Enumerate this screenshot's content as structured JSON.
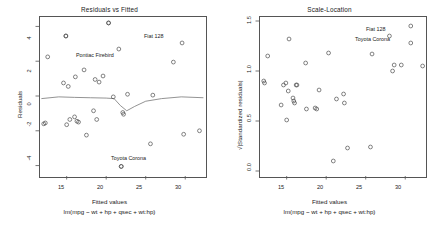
{
  "figure": {
    "panels": [
      {
        "key": "residuals_vs_fitted",
        "title": "Residuals vs Fitted",
        "xlabel": "Fitted values",
        "sublabel": "lm(mpg ~ wt + hp + qsec + wt:hp)",
        "ylabel": "Residuals",
        "xticks": [
          "15",
          "20",
          "25",
          "30"
        ],
        "yticks": [
          "4",
          "2",
          "0",
          "-2",
          "-4"
        ],
        "annotations": [
          {
            "text": "Fiat 128",
            "align": "right"
          },
          {
            "text": "Pontiac Firebird",
            "align": "left"
          },
          {
            "text": "Toyota Corona",
            "align": "right"
          }
        ]
      },
      {
        "key": "scale_location",
        "title": "Scale-Location",
        "xlabel": "Fitted values",
        "sublabel": "lm(mpg ~ wt + hp + qsec + wt:hp)",
        "ylabel": "√|Standardized residuals|",
        "xticks": [
          "15",
          "20",
          "25",
          "30"
        ],
        "yticks": [
          "1.5",
          "1.0",
          "0.5",
          "0.0"
        ],
        "annotations": [
          {
            "text": "Fiat 128",
            "align": "right"
          },
          {
            "text": "Toyota Corona",
            "align": "left"
          }
        ]
      }
    ]
  },
  "colors": {
    "point": "#4d4d4d",
    "axis": "#555555",
    "text": "#1a1a1a",
    "smoother": "#777777",
    "background": "#ffffff"
  },
  "chart_data": [
    {
      "type": "scatter",
      "title": "Residuals vs Fitted",
      "xlabel": "Fitted values",
      "sublabel": "lm(mpg ~ wt + hp + qsec + wt:hp)",
      "ylabel": "Residuals",
      "xlim": [
        11.5,
        32.5
      ],
      "ylim": [
        -4.6,
        4.6
      ],
      "xticks": [
        15,
        20,
        25,
        30
      ],
      "yticks": [
        -4,
        -2,
        0,
        2,
        4
      ],
      "grid": false,
      "legend": null,
      "points": [
        {
          "x": 12.6,
          "y": 2.25
        },
        {
          "x": 12.1,
          "y": -1.6
        },
        {
          "x": 12.3,
          "y": -1.55
        },
        {
          "x": 14.9,
          "y": 3.45
        },
        {
          "x": 14.6,
          "y": 0.75
        },
        {
          "x": 15.2,
          "y": 0.55
        },
        {
          "x": 15.0,
          "y": -1.65
        },
        {
          "x": 15.4,
          "y": -1.35
        },
        {
          "x": 16.0,
          "y": -1.2
        },
        {
          "x": 16.1,
          "y": 1.1
        },
        {
          "x": 16.3,
          "y": -1.45
        },
        {
          "x": 16.5,
          "y": -1.5
        },
        {
          "x": 17.2,
          "y": 1.5
        },
        {
          "x": 17.5,
          "y": -2.25
        },
        {
          "x": 18.4,
          "y": -0.85
        },
        {
          "x": 18.6,
          "y": 0.95
        },
        {
          "x": 19.1,
          "y": 0.8
        },
        {
          "x": 18.8,
          "y": -1.35
        },
        {
          "x": 19.6,
          "y": 1.15
        },
        {
          "x": 20.9,
          "y": -0.05
        },
        {
          "x": 21.6,
          "y": 2.7
        },
        {
          "x": 22.1,
          "y": -0.95
        },
        {
          "x": 22.2,
          "y": -1.05
        },
        {
          "x": 22.7,
          "y": 0.1
        },
        {
          "x": 25.6,
          "y": -2.75
        },
        {
          "x": 25.9,
          "y": 0.05
        },
        {
          "x": 28.5,
          "y": 1.95
        },
        {
          "x": 29.6,
          "y": 3.05
        },
        {
          "x": 29.8,
          "y": -2.2
        },
        {
          "x": 31.8,
          "y": -2.0
        },
        {
          "x": 21.9,
          "y": -4.05
        },
        {
          "x": 20.3,
          "y": 4.2
        }
      ],
      "smoother": [
        {
          "x": 11.8,
          "y": -0.15
        },
        {
          "x": 14.0,
          "y": -0.05
        },
        {
          "x": 16.0,
          "y": -0.08
        },
        {
          "x": 18.0,
          "y": -0.1
        },
        {
          "x": 20.0,
          "y": -0.12
        },
        {
          "x": 21.0,
          "y": -0.15
        },
        {
          "x": 21.8,
          "y": -0.55
        },
        {
          "x": 22.6,
          "y": -0.85
        },
        {
          "x": 23.6,
          "y": -0.6
        },
        {
          "x": 25.0,
          "y": -0.3
        },
        {
          "x": 27.0,
          "y": -0.15
        },
        {
          "x": 29.5,
          "y": -0.05
        },
        {
          "x": 32.3,
          "y": -0.1
        }
      ],
      "labeled_points": [
        {
          "label": "Fiat 128",
          "x": 20.3,
          "y": 4.2
        },
        {
          "label": "Pontiac Firebird",
          "x": 14.9,
          "y": 3.45
        },
        {
          "label": "Toyota Corona",
          "x": 21.9,
          "y": -4.05
        }
      ]
    },
    {
      "type": "scatter",
      "title": "Scale-Location",
      "xlabel": "Fitted values",
      "sublabel": "lm(mpg ~ wt + hp + qsec + wt:hp)",
      "ylabel": "√|Standardized residuals|",
      "xlim": [
        11.5,
        32.5
      ],
      "ylim": [
        -0.05,
        1.55
      ],
      "xticks": [
        15,
        20,
        25,
        30
      ],
      "yticks": [
        0.0,
        0.5,
        1.0,
        1.5
      ],
      "grid": false,
      "legend": null,
      "points": [
        {
          "x": 12.1,
          "y": 0.9
        },
        {
          "x": 12.2,
          "y": 0.88
        },
        {
          "x": 12.6,
          "y": 1.15
        },
        {
          "x": 14.3,
          "y": 0.66
        },
        {
          "x": 14.6,
          "y": 0.86
        },
        {
          "x": 14.9,
          "y": 0.88
        },
        {
          "x": 15.0,
          "y": 0.51
        },
        {
          "x": 15.2,
          "y": 0.8
        },
        {
          "x": 15.3,
          "y": 1.32
        },
        {
          "x": 15.8,
          "y": 0.73
        },
        {
          "x": 16.0,
          "y": 0.68
        },
        {
          "x": 16.2,
          "y": 0.86
        },
        {
          "x": 16.3,
          "y": 0.86
        },
        {
          "x": 15.9,
          "y": 0.7
        },
        {
          "x": 17.4,
          "y": 1.08
        },
        {
          "x": 17.5,
          "y": 0.62
        },
        {
          "x": 18.6,
          "y": 0.63
        },
        {
          "x": 18.8,
          "y": 0.62
        },
        {
          "x": 19.1,
          "y": 0.81
        },
        {
          "x": 20.3,
          "y": 1.18
        },
        {
          "x": 20.9,
          "y": 0.1
        },
        {
          "x": 21.3,
          "y": 0.72
        },
        {
          "x": 22.2,
          "y": 0.77
        },
        {
          "x": 22.3,
          "y": 0.68
        },
        {
          "x": 22.7,
          "y": 0.23
        },
        {
          "x": 25.6,
          "y": 0.24
        },
        {
          "x": 25.8,
          "y": 1.17
        },
        {
          "x": 28.4,
          "y": 1.0
        },
        {
          "x": 28.6,
          "y": 1.06
        },
        {
          "x": 29.5,
          "y": 1.06
        },
        {
          "x": 30.7,
          "y": 1.28
        },
        {
          "x": 32.2,
          "y": 1.05
        }
      ],
      "labeled_points": [
        {
          "label": "Fiat 128",
          "x": 30.7,
          "y": 1.45
        },
        {
          "label": "Toyota Corona",
          "x": 28.0,
          "y": 1.35
        }
      ]
    }
  ]
}
